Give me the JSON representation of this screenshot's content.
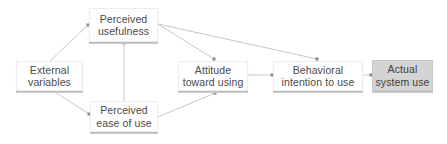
{
  "diagram": {
    "type": "flowchart",
    "title": "",
    "nodes": [
      {
        "id": "external_variables",
        "line1": "External",
        "line2": "variables"
      },
      {
        "id": "perceived_usefulness",
        "line1": "Perceived",
        "line2": "usefulness"
      },
      {
        "id": "perceived_ease_of_use",
        "line1": "Perceived",
        "line2": "ease of use"
      },
      {
        "id": "attitude_toward_using",
        "line1": "Attitude",
        "line2": "toward using"
      },
      {
        "id": "behavioral_intention",
        "line1": "Behavioral",
        "line2": "intention to use"
      },
      {
        "id": "actual_system_use",
        "line1": "Actual",
        "line2": "system use"
      }
    ],
    "edges": [
      {
        "from": "external_variables",
        "to": "perceived_usefulness"
      },
      {
        "from": "external_variables",
        "to": "perceived_ease_of_use"
      },
      {
        "from": "perceived_ease_of_use",
        "to": "perceived_usefulness"
      },
      {
        "from": "perceived_usefulness",
        "to": "attitude_toward_using"
      },
      {
        "from": "perceived_usefulness",
        "to": "behavioral_intention"
      },
      {
        "from": "perceived_ease_of_use",
        "to": "attitude_toward_using"
      },
      {
        "from": "attitude_toward_using",
        "to": "behavioral_intention"
      },
      {
        "from": "behavioral_intention",
        "to": "actual_system_use"
      }
    ],
    "colors": {
      "node_fill": "#ffffff",
      "final_node_fill": "#d4d4d4",
      "edge": "#c4c4c4",
      "text": "#4a4a4a"
    }
  }
}
